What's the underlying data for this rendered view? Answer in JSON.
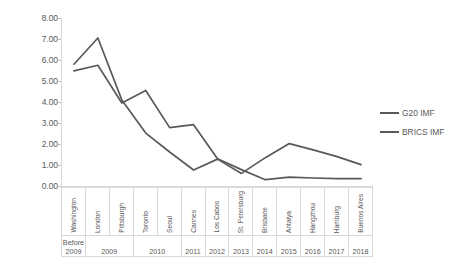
{
  "chart_data": {
    "type": "line",
    "title": "",
    "xlabel": "",
    "ylabel": "",
    "ylim": [
      0,
      8
    ],
    "ytick_step": 1,
    "grid": false,
    "legend_position": "right",
    "categories": [
      "Washington",
      "London",
      "Pittsburgh",
      "Toronto",
      "Seoul",
      "Cannes",
      "Los Cabos",
      "St. Petersburg",
      "Brisbane",
      "Antalya",
      "Hangzhou",
      "Hamburg",
      "Buenos Aires"
    ],
    "year_groups": [
      {
        "label": "Before 2009",
        "span": 1
      },
      {
        "label": "2009",
        "span": 2
      },
      {
        "label": "2010",
        "span": 2
      },
      {
        "label": "2011",
        "span": 1
      },
      {
        "label": "2012",
        "span": 1
      },
      {
        "label": "2013",
        "span": 1
      },
      {
        "label": "2014",
        "span": 1
      },
      {
        "label": "2015",
        "span": 1
      },
      {
        "label": "2016",
        "span": 1
      },
      {
        "label": "2017",
        "span": 1
      },
      {
        "label": "2018",
        "span": 1
      }
    ],
    "ytick_labels": [
      "8.00",
      "7.00",
      "6.00",
      "5.00",
      "4.00",
      "3.00",
      "2.00",
      "1.00",
      "0.00"
    ],
    "series": [
      {
        "name": "G20 IMF",
        "color": "#595959",
        "values": [
          5.48,
          5.75,
          3.95,
          4.55,
          2.78,
          2.92,
          1.3,
          0.78,
          0.3,
          0.42,
          0.38,
          0.35,
          0.35
        ]
      },
      {
        "name": "BRICS IMF",
        "color": "#595959",
        "values": [
          5.8,
          7.05,
          4.1,
          2.52,
          1.62,
          0.76,
          1.28,
          0.6,
          1.35,
          2.02,
          1.72,
          1.4,
          1.02
        ]
      }
    ]
  },
  "legend": {
    "items": [
      {
        "label": "G20 IMF"
      },
      {
        "label": "BRICS IMF"
      }
    ]
  },
  "colors": {
    "series_line": "#595959",
    "axis": "#d9d9d9",
    "text": "#595959",
    "background": "#ffffff"
  }
}
